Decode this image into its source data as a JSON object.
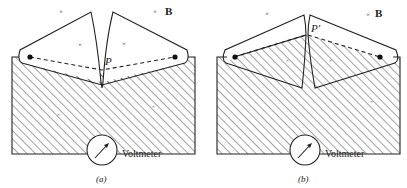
{
  "figure": {
    "panels": [
      {
        "id": "a",
        "caption": "(a)",
        "point_label": "P",
        "field_label": "B",
        "meter_label": "Voltmeter"
      },
      {
        "id": "b",
        "caption": "(b)",
        "point_label": "P′",
        "field_label": "B",
        "meter_label": "Voltmeter"
      }
    ],
    "field_marker": "×",
    "colors": {
      "line": "#222222",
      "hatch": "#333333",
      "background": "#ffffff"
    }
  }
}
